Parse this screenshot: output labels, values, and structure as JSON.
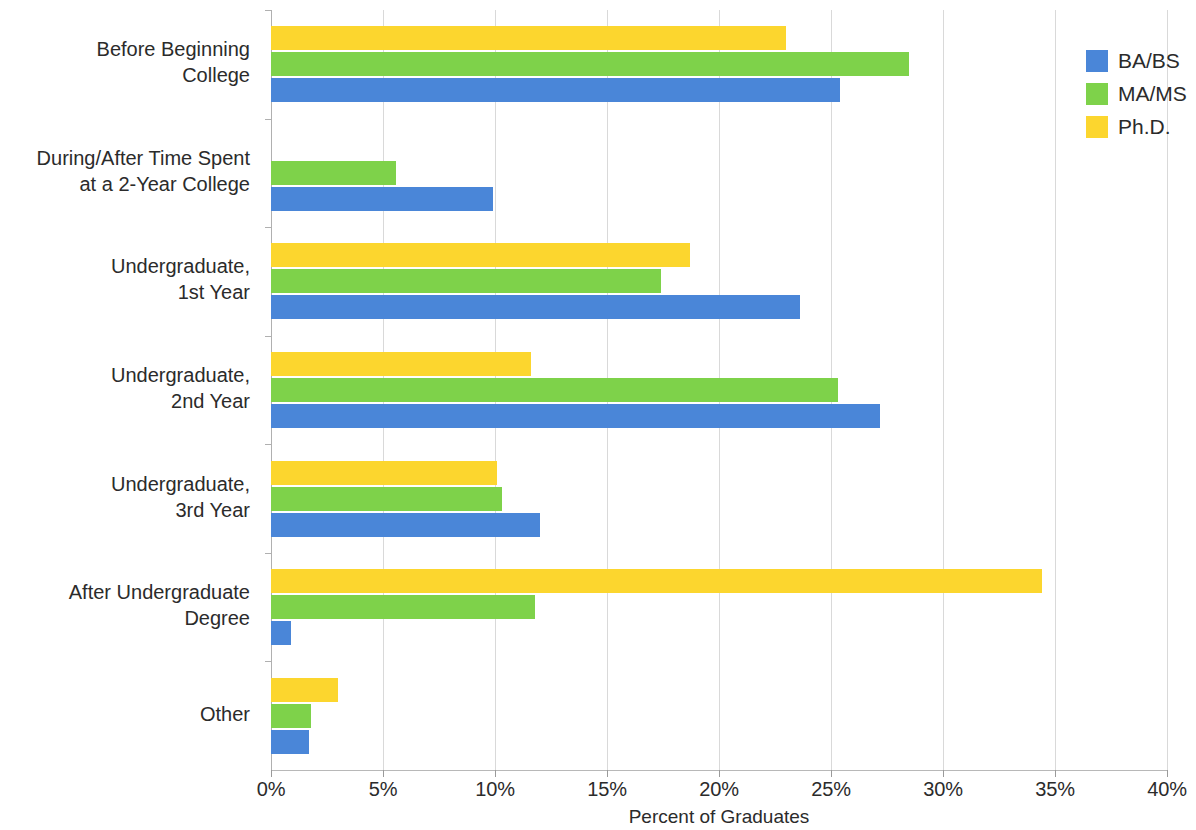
{
  "chart_data": {
    "type": "bar",
    "orientation": "horizontal",
    "title": "",
    "xlabel": "Percent of Graduates",
    "ylabel": "",
    "xlim": [
      0,
      40
    ],
    "xticks": [
      "0%",
      "5%",
      "10%",
      "15%",
      "20%",
      "25%",
      "30%",
      "35%",
      "40%"
    ],
    "xtick_values": [
      0,
      5,
      10,
      15,
      20,
      25,
      30,
      35,
      40
    ],
    "grid": true,
    "legend_position": "right",
    "categories": [
      "Before Beginning\nCollege",
      "During/After Time Spent\nat a 2-Year College",
      "Undergraduate,\n1st Year",
      "Undergraduate,\n2nd Year",
      "Undergraduate,\n3rd Year",
      "After Undergraduate\nDegree",
      "Other"
    ],
    "series": [
      {
        "name": "BA/BS",
        "color": "#4a86d8",
        "values": [
          25.4,
          9.9,
          23.6,
          27.2,
          12.0,
          0.9,
          1.7
        ]
      },
      {
        "name": "MA/MS",
        "color": "#7ed24a",
        "values": [
          28.5,
          5.6,
          17.4,
          25.3,
          10.3,
          11.8,
          1.8
        ]
      },
      {
        "name": "Ph.D.",
        "color": "#fcd62e",
        "values": [
          23.0,
          0,
          18.7,
          11.6,
          10.1,
          34.4,
          3.0
        ]
      }
    ]
  },
  "legend": {
    "items": [
      {
        "label": "BA/BS",
        "color": "#4a86d8"
      },
      {
        "label": "MA/MS",
        "color": "#7ed24a"
      },
      {
        "label": "Ph.D.",
        "color": "#fcd62e"
      }
    ]
  },
  "axis": {
    "x_title": "Percent of Graduates"
  }
}
